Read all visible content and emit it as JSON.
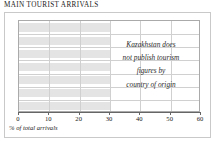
{
  "chart_data": {
    "type": "bar",
    "title": "MAIN TOURIST ARRIVALS",
    "orientation": "horizontal",
    "xlabel": "% of total arrivals",
    "ylabel": "",
    "xlim": [
      0,
      60
    ],
    "xticks": [
      0,
      10,
      20,
      30,
      40,
      50,
      60
    ],
    "xtick_labels": [
      "0",
      "10",
      "20",
      "30",
      "40",
      "50",
      "60"
    ],
    "grid": true,
    "legend": false,
    "categories": [
      "",
      "",
      "",
      "",
      "",
      "",
      ""
    ],
    "values": [
      30,
      30,
      30,
      30,
      30,
      30,
      30
    ],
    "data_available": false,
    "annotation": "Kazakhstan does not publish tourism figures by country of origin",
    "annotation_lines": [
      "Kazakhstan does",
      "not publish tourism",
      "figures by",
      "country of origin"
    ],
    "colors": {
      "band": "#e4e4e4",
      "gridline": "#d0d0d0",
      "axis": "#666666",
      "frame": "#aaaaaa",
      "outer_frame": "#c9c9c9",
      "text": "#1a1a1a",
      "background": "#ffffff"
    }
  },
  "title": "MAIN TOURIST ARRIVALS",
  "axis": {
    "ticks": [
      {
        "label": "0",
        "value": 0
      },
      {
        "label": "10",
        "value": 10
      },
      {
        "label": "20",
        "value": 20
      },
      {
        "label": "30",
        "value": 30
      },
      {
        "label": "40",
        "value": 40
      },
      {
        "label": "50",
        "value": 50
      },
      {
        "label": "60",
        "value": 60
      }
    ],
    "caption": "% of total arrivals"
  },
  "note": {
    "lines": [
      "Kazakhstan does",
      "not publish tourism",
      "figures by",
      "country of origin"
    ]
  }
}
